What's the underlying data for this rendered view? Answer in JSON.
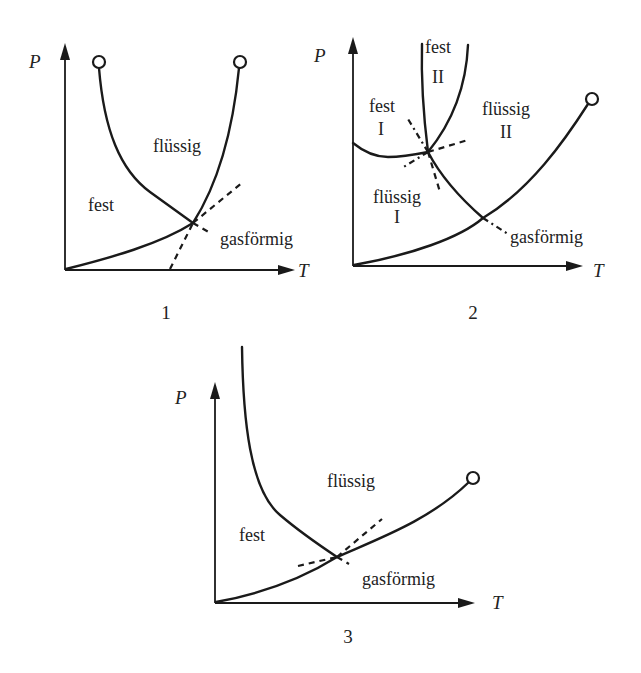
{
  "figure": {
    "colors": {
      "ink": "#1a1a1a",
      "background": "#ffffff"
    }
  },
  "diagrams": [
    {
      "number": "1",
      "axes": {
        "y": "P",
        "x": "T"
      },
      "regions": {
        "solid": "fest",
        "liquid": "flüssig",
        "gas": "gasförmig"
      },
      "features": [
        "triple point",
        "two critical points (circles)",
        "dashed metastable extensions"
      ]
    },
    {
      "number": "2",
      "axes": {
        "y": "P",
        "x": "T"
      },
      "regions": {
        "solid2_word": "fest",
        "solid2_numeral": "II",
        "solid1_word": "fest",
        "solid1_numeral": "I",
        "liquid2_word": "flüssig",
        "liquid2_numeral": "II",
        "liquid1_word": "flüssig",
        "liquid1_numeral": "I",
        "gas": "gasförmig"
      },
      "features": [
        "two triple points",
        "one critical point (circle)",
        "dashed metastable extensions"
      ]
    },
    {
      "number": "3",
      "axes": {
        "y": "P",
        "x": "T"
      },
      "regions": {
        "solid": "fest",
        "liquid": "flüssig",
        "gas": "gasförmig"
      },
      "features": [
        "triple point",
        "one critical point (circle)",
        "dashed metastable extensions"
      ]
    }
  ]
}
